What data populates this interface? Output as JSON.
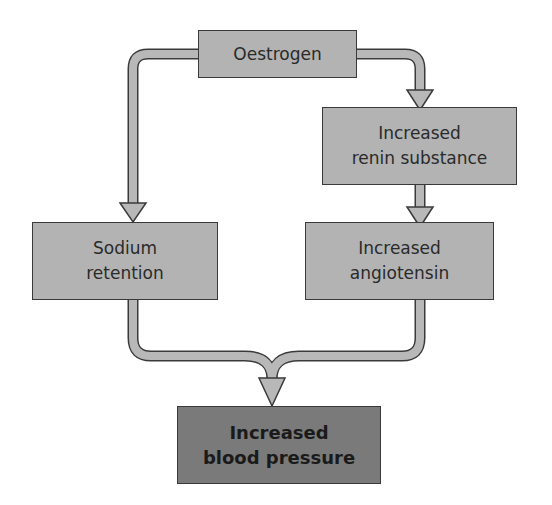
{
  "diagram": {
    "nodes": [
      {
        "id": "oestrogen",
        "label": "Oestrogen"
      },
      {
        "id": "renin",
        "label": "Increased\nrenin substance"
      },
      {
        "id": "sodium",
        "label": "Sodium\nretention"
      },
      {
        "id": "angiotensin",
        "label": "Increased\nangiotensin"
      },
      {
        "id": "bp",
        "label": "Increased\nblood pressure"
      }
    ],
    "edges": [
      {
        "from": "oestrogen",
        "to": "sodium"
      },
      {
        "from": "oestrogen",
        "to": "renin"
      },
      {
        "from": "renin",
        "to": "angiotensin"
      },
      {
        "from": "sodium",
        "to": "bp"
      },
      {
        "from": "angiotensin",
        "to": "bp"
      }
    ],
    "colors": {
      "box_fill": "#b3b3b3",
      "final_box_fill": "#7a7a7a",
      "arrow_fill": "#b8b8b8",
      "outline": "#3a3a3a"
    }
  }
}
